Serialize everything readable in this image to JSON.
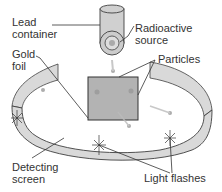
{
  "diagram": {
    "labels": {
      "lead_container": [
        "Lead",
        "container"
      ],
      "radioactive_source": [
        "Radioactive",
        "source"
      ],
      "gold_foil": [
        "Gold",
        "foil"
      ],
      "particles": "Particles",
      "detecting_screen": [
        "Detecting",
        "screen"
      ],
      "light_flashes": "Light flashes"
    },
    "colors": {
      "screen_fill": "#d9d9d9",
      "screen_outline": "#404040",
      "foil_fill": "#b3b3b3",
      "container_fill": "#cccccc",
      "leader_line": "#333333",
      "text": "#333333"
    }
  }
}
